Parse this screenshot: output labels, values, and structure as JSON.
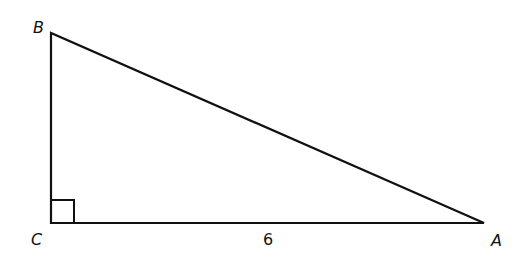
{
  "diagram": {
    "type": "right-triangle",
    "stroke_color": "#111111",
    "background": "#ffffff",
    "vertices": {
      "B": {
        "label": "B",
        "x": 51,
        "y": 33
      },
      "C": {
        "label": "C",
        "x": 51,
        "y": 223
      },
      "A": {
        "label": "A",
        "x": 484,
        "y": 223
      }
    },
    "right_angle_at": "C",
    "sides": {
      "CA": {
        "label": "6"
      }
    }
  }
}
